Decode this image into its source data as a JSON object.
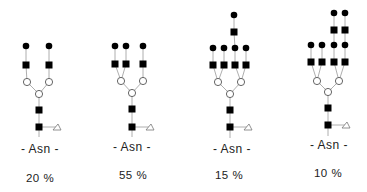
{
  "figure": {
    "type": "N-glycan structures",
    "legend_symbols": {
      "filled-circle": "galactose",
      "filled-square": "GlcNAc",
      "open-circle": "mannose",
      "open-triangle": "fucose"
    }
  },
  "structures": [
    {
      "id": "biantennary",
      "anchor_label": "- Asn -",
      "percentage": "20 %",
      "color": "#000000",
      "nodes": [
        {
          "t": "fc",
          "x": 26,
          "y": 46
        },
        {
          "t": "fc",
          "x": 49,
          "y": 46
        },
        {
          "t": "fs",
          "x": 26,
          "y": 65
        },
        {
          "t": "fs",
          "x": 49,
          "y": 65
        },
        {
          "t": "oc",
          "x": 27,
          "y": 82
        },
        {
          "t": "oc",
          "x": 49,
          "y": 82
        },
        {
          "t": "oc",
          "x": 39,
          "y": 94
        },
        {
          "t": "fs",
          "x": 39,
          "y": 110
        },
        {
          "t": "fs",
          "x": 39,
          "y": 127
        },
        {
          "t": "ot",
          "x": 57,
          "y": 127
        }
      ],
      "edges": [
        [
          0,
          2
        ],
        [
          1,
          3
        ],
        [
          2,
          4
        ],
        [
          3,
          5
        ],
        [
          4,
          6
        ],
        [
          5,
          6
        ],
        [
          6,
          7
        ],
        [
          7,
          8
        ],
        [
          8,
          9
        ]
      ],
      "stem_bottom": 137,
      "label_pos": {
        "x": 40,
        "y": 149
      },
      "pct_pos": {
        "x": 40,
        "y": 178
      }
    },
    {
      "id": "triantennary",
      "anchor_label": "- Asn -",
      "percentage": "55 %",
      "color": "#000000",
      "nodes": [
        {
          "t": "fc",
          "x": 115,
          "y": 46
        },
        {
          "t": "fc",
          "x": 126,
          "y": 46
        },
        {
          "t": "fc",
          "x": 143,
          "y": 46
        },
        {
          "t": "fs",
          "x": 115,
          "y": 64
        },
        {
          "t": "fs",
          "x": 126,
          "y": 64
        },
        {
          "t": "fs",
          "x": 143,
          "y": 64
        },
        {
          "t": "oc",
          "x": 121,
          "y": 81
        },
        {
          "t": "oc",
          "x": 143,
          "y": 81
        },
        {
          "t": "oc",
          "x": 132,
          "y": 93
        },
        {
          "t": "fs",
          "x": 132,
          "y": 109
        },
        {
          "t": "fs",
          "x": 132,
          "y": 127
        },
        {
          "t": "ot",
          "x": 150,
          "y": 127
        }
      ],
      "edges": [
        [
          0,
          3
        ],
        [
          1,
          4
        ],
        [
          2,
          5
        ],
        [
          3,
          6
        ],
        [
          4,
          6
        ],
        [
          5,
          7
        ],
        [
          6,
          8
        ],
        [
          7,
          8
        ],
        [
          8,
          9
        ],
        [
          9,
          10
        ],
        [
          10,
          11
        ]
      ],
      "stem_bottom": 137,
      "label_pos": {
        "x": 132,
        "y": 147
      },
      "pct_pos": {
        "x": 133,
        "y": 175
      }
    },
    {
      "id": "tetraantennary-1-lacnac-repeat",
      "anchor_label": "- Asn -",
      "percentage": "15 %",
      "color": "#000000",
      "nodes": [
        {
          "t": "fc",
          "x": 234,
          "y": 15
        },
        {
          "t": "fs",
          "x": 234,
          "y": 32
        },
        {
          "t": "fc",
          "x": 213,
          "y": 48
        },
        {
          "t": "fc",
          "x": 224,
          "y": 48
        },
        {
          "t": "fc",
          "x": 235,
          "y": 48
        },
        {
          "t": "fc",
          "x": 246,
          "y": 48
        },
        {
          "t": "fs",
          "x": 213,
          "y": 65
        },
        {
          "t": "fs",
          "x": 224,
          "y": 65
        },
        {
          "t": "fs",
          "x": 235,
          "y": 65
        },
        {
          "t": "fs",
          "x": 246,
          "y": 65
        },
        {
          "t": "oc",
          "x": 218,
          "y": 82
        },
        {
          "t": "oc",
          "x": 241,
          "y": 82
        },
        {
          "t": "oc",
          "x": 230,
          "y": 94
        },
        {
          "t": "fs",
          "x": 230,
          "y": 110
        },
        {
          "t": "fs",
          "x": 230,
          "y": 127
        },
        {
          "t": "ot",
          "x": 248,
          "y": 127
        }
      ],
      "edges": [
        [
          0,
          1
        ],
        [
          1,
          4
        ],
        [
          2,
          6
        ],
        [
          3,
          7
        ],
        [
          4,
          8
        ],
        [
          5,
          9
        ],
        [
          6,
          10
        ],
        [
          7,
          10
        ],
        [
          8,
          11
        ],
        [
          9,
          11
        ],
        [
          10,
          12
        ],
        [
          11,
          12
        ],
        [
          12,
          13
        ],
        [
          13,
          14
        ],
        [
          14,
          15
        ]
      ],
      "stem_bottom": 138,
      "label_pos": {
        "x": 232,
        "y": 149
      },
      "pct_pos": {
        "x": 229,
        "y": 175
      }
    },
    {
      "id": "tetraantennary-2-lacnac-repeats",
      "anchor_label": "- Asn -",
      "percentage": "10 %",
      "color": "#000000",
      "nodes": [
        {
          "t": "fc",
          "x": 334,
          "y": 13
        },
        {
          "t": "fc",
          "x": 345,
          "y": 13
        },
        {
          "t": "fs",
          "x": 334,
          "y": 30
        },
        {
          "t": "fs",
          "x": 345,
          "y": 30
        },
        {
          "t": "fc",
          "x": 311,
          "y": 45
        },
        {
          "t": "fc",
          "x": 322,
          "y": 45
        },
        {
          "t": "fc",
          "x": 334,
          "y": 45
        },
        {
          "t": "fc",
          "x": 345,
          "y": 45
        },
        {
          "t": "fs",
          "x": 311,
          "y": 62
        },
        {
          "t": "fs",
          "x": 322,
          "y": 62
        },
        {
          "t": "fs",
          "x": 334,
          "y": 62
        },
        {
          "t": "fs",
          "x": 345,
          "y": 62
        },
        {
          "t": "oc",
          "x": 317,
          "y": 81
        },
        {
          "t": "oc",
          "x": 339,
          "y": 81
        },
        {
          "t": "oc",
          "x": 328,
          "y": 92
        },
        {
          "t": "fs",
          "x": 328,
          "y": 108
        },
        {
          "t": "fs",
          "x": 328,
          "y": 125
        },
        {
          "t": "ot",
          "x": 346,
          "y": 125
        }
      ],
      "edges": [
        [
          0,
          2
        ],
        [
          1,
          3
        ],
        [
          2,
          6
        ],
        [
          3,
          7
        ],
        [
          4,
          8
        ],
        [
          5,
          9
        ],
        [
          6,
          10
        ],
        [
          7,
          11
        ],
        [
          8,
          12
        ],
        [
          9,
          12
        ],
        [
          10,
          13
        ],
        [
          11,
          13
        ],
        [
          12,
          14
        ],
        [
          13,
          14
        ],
        [
          14,
          15
        ],
        [
          15,
          16
        ],
        [
          16,
          17
        ]
      ],
      "stem_bottom": 136,
      "label_pos": {
        "x": 329,
        "y": 145
      },
      "pct_pos": {
        "x": 328,
        "y": 173
      }
    }
  ]
}
